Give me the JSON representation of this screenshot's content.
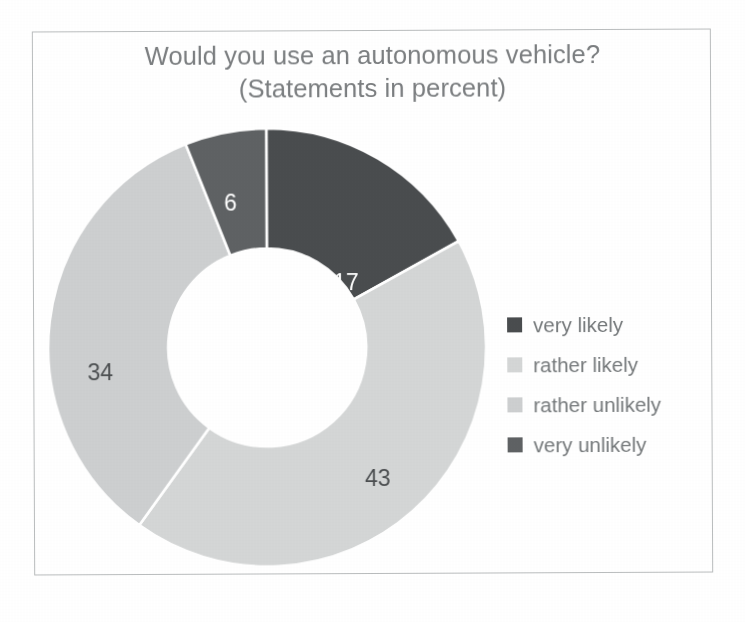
{
  "chart_data": {
    "type": "pie",
    "variant": "donut",
    "title": "Would you use an autonomous vehicle?",
    "subtitle": "(Statements in percent)",
    "unit": "percent",
    "start_angle_deg": 0,
    "direction": "clockwise",
    "inner_radius_ratio": 0.45,
    "legend_position": "right",
    "grid": false,
    "categories": [
      "very likely",
      "rather likely",
      "rather unlikely",
      "very unlikely"
    ],
    "values": [
      17,
      43,
      34,
      6
    ],
    "data_labels": [
      "17",
      "43",
      "34",
      "6"
    ],
    "colors": [
      "#4a4d4f",
      "#d4d6d6",
      "#cdcfd0",
      "#5f6264"
    ],
    "label_text_colors": [
      "#ffffff",
      "#4c4f51",
      "#4c4f51",
      "#ffffff"
    ],
    "slices": [
      {
        "label": "very likely",
        "value": 17,
        "display": "17",
        "color": "#4a4d4f",
        "label_color": "#ffffff",
        "label_x": 299,
        "label_y": 156
      },
      {
        "label": "rather likely",
        "value": 43,
        "display": "43",
        "color": "#d4d6d6",
        "label_color": "#4c4f51",
        "label_x": 330,
        "label_y": 352
      },
      {
        "label": "rather unlikely",
        "value": 34,
        "display": "34",
        "color": "#cdcfd0",
        "label_color": "#4c4f51",
        "label_x": 53,
        "label_y": 245
      },
      {
        "label": "very unlikely",
        "value": 6,
        "display": "6",
        "color": "#5f6264",
        "label_color": "#ffffff",
        "label_x": 184,
        "label_y": 76
      }
    ],
    "separator_color": "#ffffff",
    "background": "#ffffff"
  },
  "frame": {
    "border_color": "#b9bcbd"
  },
  "title": {
    "line1": "Would you use an autonomous vehicle?",
    "line2": "(Statements in percent)",
    "color": "#7b7e80"
  },
  "legend": {
    "items": [
      {
        "label": "very likely",
        "swatch": "#4a4d4f",
        "swatch_name": "legend-swatch-very-likely"
      },
      {
        "label": "rather likely",
        "swatch": "#d4d6d6",
        "swatch_name": "legend-swatch-rather-likely"
      },
      {
        "label": "rather unlikely",
        "swatch": "#cdcfd0",
        "swatch_name": "legend-swatch-rather-unlikely"
      },
      {
        "label": "very unlikely",
        "swatch": "#5f6264",
        "swatch_name": "legend-swatch-very-unlikely"
      }
    ]
  }
}
